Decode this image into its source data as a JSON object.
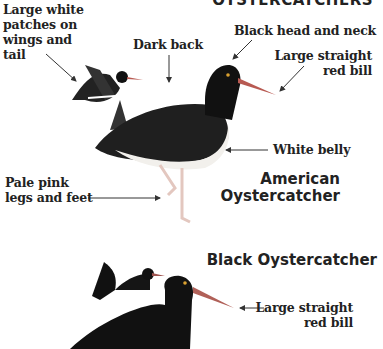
{
  "header": {
    "title_partial": "OYSTERCATCHERS"
  },
  "american": {
    "title_line1": "American",
    "title_line2": "Oystercatcher",
    "labels": {
      "white_patches": [
        "Large white",
        "patches on",
        "wings and",
        "tail"
      ],
      "dark_back": "Dark back",
      "head_neck": "Black head and neck",
      "bill": [
        "Large straight",
        "red bill"
      ],
      "belly": "White belly",
      "legs": [
        "Pale pink",
        "legs and feet"
      ]
    }
  },
  "black": {
    "title": "Black Oystercatcher",
    "labels": {
      "bill": [
        "Large straight",
        "red bill"
      ]
    }
  },
  "colors": {
    "text": "#222222",
    "bird_dark": "#1a1a1a",
    "bill": "#c0605a",
    "legs": "#e8c8c0"
  }
}
